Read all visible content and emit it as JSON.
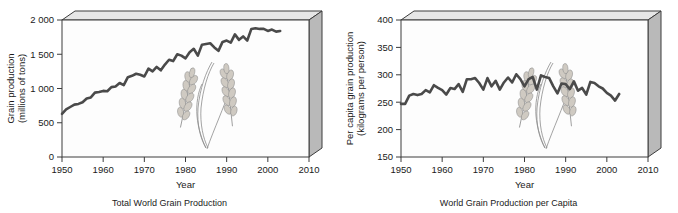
{
  "figure": {
    "panels": [
      {
        "id": "total-world-grain-production",
        "caption": "Total World Grain Production",
        "xlabel": "Year",
        "ylabel_line1": "Grain production",
        "ylabel_line2": "(millions of tons)",
        "xticks": [
          "1950",
          "1960",
          "1970",
          "1980",
          "1990",
          "2000",
          "2010"
        ],
        "yticks": [
          "0",
          "500",
          "1 000",
          "1 500",
          "2 000"
        ]
      },
      {
        "id": "world-grain-production-per-capita",
        "caption": "World Grain Production per Capita",
        "xlabel": "Year",
        "ylabel_line1": "Per capita grain production",
        "ylabel_line2": "(kilograms per person)",
        "xticks": [
          "1950",
          "1960",
          "1970",
          "1980",
          "1990",
          "2000",
          "2010"
        ],
        "yticks": [
          "150",
          "200",
          "250",
          "300",
          "350",
          "400"
        ]
      }
    ],
    "colors": {
      "series": "#4a4a4a",
      "frame": "#3c3c3c",
      "side_face": "#b9b9b9",
      "top_face": "#e6e6e6",
      "plot_background": "#fdfdfd",
      "wheat": "#8c8c8c"
    },
    "decoration": {
      "wheat_illustration": "two wheat stalks drawn inside each plot area"
    }
  },
  "chart_data": [
    {
      "type": "line",
      "title": "Total World Grain Production",
      "xlabel": "Year",
      "ylabel": "Grain production (millions of tons)",
      "xlim": [
        1950,
        2010
      ],
      "ylim": [
        0,
        2000
      ],
      "xticks": [
        1950,
        1960,
        1970,
        1980,
        1990,
        2000,
        2010
      ],
      "yticks": [
        0,
        500,
        1000,
        1500,
        2000
      ],
      "grid": false,
      "legend": "none",
      "series": [
        {
          "name": "World grain production",
          "x": [
            1950,
            1951,
            1952,
            1953,
            1954,
            1955,
            1956,
            1957,
            1958,
            1959,
            1960,
            1961,
            1962,
            1963,
            1964,
            1965,
            1966,
            1967,
            1968,
            1969,
            1970,
            1971,
            1972,
            1973,
            1974,
            1975,
            1976,
            1977,
            1978,
            1979,
            1980,
            1981,
            1982,
            1983,
            1984,
            1985,
            1986,
            1987,
            1988,
            1989,
            1990,
            1991,
            1992,
            1993,
            1994,
            1995,
            1996,
            1997,
            1998,
            1999,
            2000,
            2001,
            2002,
            2003
          ],
          "values": [
            631,
            695,
            730,
            765,
            775,
            800,
            855,
            870,
            940,
            950,
            965,
            960,
            1020,
            1030,
            1080,
            1050,
            1165,
            1185,
            1215,
            1200,
            1175,
            1290,
            1250,
            1315,
            1265,
            1350,
            1420,
            1400,
            1500,
            1480,
            1440,
            1530,
            1580,
            1480,
            1640,
            1650,
            1660,
            1600,
            1550,
            1680,
            1700,
            1670,
            1790,
            1710,
            1760,
            1700,
            1870,
            1880,
            1870,
            1870,
            1840,
            1860,
            1830,
            1840
          ]
        }
      ]
    },
    {
      "type": "line",
      "title": "World Grain Production per Capita",
      "xlabel": "Year",
      "ylabel": "Per capita grain production (kilograms per person)",
      "xlim": [
        1950,
        2010
      ],
      "ylim": [
        150,
        400
      ],
      "xticks": [
        1950,
        1960,
        1970,
        1980,
        1990,
        2000,
        2010
      ],
      "yticks": [
        150,
        200,
        250,
        300,
        350,
        400
      ],
      "grid": false,
      "legend": "none",
      "series": [
        {
          "name": "Per capita world grain production",
          "x": [
            1950,
            1951,
            1952,
            1953,
            1954,
            1955,
            1956,
            1957,
            1958,
            1959,
            1960,
            1961,
            1962,
            1963,
            1964,
            1965,
            1966,
            1967,
            1968,
            1969,
            1970,
            1971,
            1972,
            1973,
            1974,
            1975,
            1976,
            1977,
            1978,
            1979,
            1980,
            1981,
            1982,
            1983,
            1984,
            1985,
            1986,
            1987,
            1988,
            1989,
            1990,
            1991,
            1992,
            1993,
            1994,
            1995,
            1996,
            1997,
            1998,
            1999,
            2000,
            2001,
            2002,
            2003
          ],
          "values": [
            247,
            247,
            262,
            265,
            263,
            265,
            272,
            268,
            281,
            276,
            272,
            264,
            276,
            274,
            283,
            269,
            292,
            292,
            294,
            285,
            273,
            294,
            279,
            289,
            273,
            286,
            295,
            286,
            301,
            292,
            279,
            292,
            296,
            273,
            299,
            296,
            294,
            279,
            266,
            284,
            283,
            274,
            288,
            271,
            276,
            264,
            287,
            285,
            279,
            275,
            267,
            262,
            253,
            265
          ]
        }
      ]
    }
  ]
}
